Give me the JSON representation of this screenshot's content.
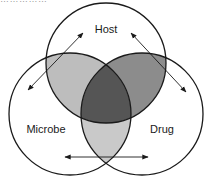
{
  "diagram": {
    "type": "venn-3",
    "sets": [
      {
        "id": "host",
        "label": "Host",
        "cx": 106,
        "cy": 63,
        "r": 60,
        "label_x": 106,
        "label_y": 33
      },
      {
        "id": "microbe",
        "label": "Microbe",
        "cx": 70,
        "cy": 114,
        "r": 61,
        "label_x": 46,
        "label_y": 133
      },
      {
        "id": "drug",
        "label": "Drug",
        "cx": 142,
        "cy": 114,
        "r": 61,
        "label_x": 162,
        "label_y": 133
      }
    ],
    "regions": [
      {
        "id": "host-microbe",
        "sets": [
          "host",
          "microbe"
        ],
        "fill": "#bdbdbd"
      },
      {
        "id": "host-drug",
        "sets": [
          "host",
          "drug"
        ],
        "fill": "#8c8c8c"
      },
      {
        "id": "microbe-drug",
        "sets": [
          "microbe",
          "drug"
        ],
        "fill": "#c9c9c9"
      },
      {
        "id": "host-microbe-drug",
        "sets": [
          "host",
          "microbe",
          "drug"
        ],
        "fill": "#555555"
      }
    ],
    "arrows": [
      {
        "id": "host-microbe-arrow",
        "from": [
          28,
          90
        ],
        "to": [
          83,
          33
        ],
        "double_headed": true
      },
      {
        "id": "host-drug-arrow",
        "from": [
          131,
          33
        ],
        "to": [
          186,
          92
        ],
        "double_headed": true
      },
      {
        "id": "microbe-drug-arrow",
        "from": [
          65,
          157
        ],
        "to": [
          148,
          157
        ],
        "double_headed": true
      }
    ],
    "stroke_color": "#1a1a1a"
  },
  "header": {
    "clipped_text": "……………"
  }
}
